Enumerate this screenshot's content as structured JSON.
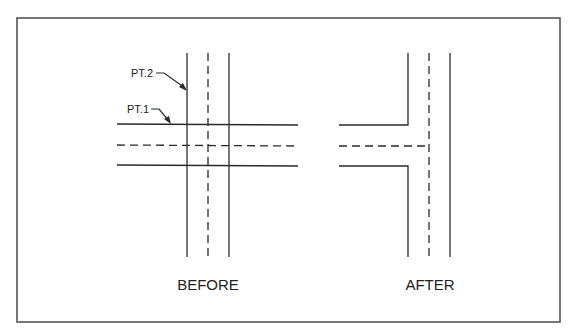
{
  "diagram": {
    "frame": {
      "x": 17,
      "y": 18,
      "width": 543,
      "height": 304,
      "stroke": "#555555"
    },
    "line_color": "#2a2a2a",
    "before": {
      "label": "BEFORE",
      "callouts": [
        {
          "text": "PT.2"
        },
        {
          "text": "PT.1"
        }
      ]
    },
    "after": {
      "label": "AFTER"
    }
  }
}
